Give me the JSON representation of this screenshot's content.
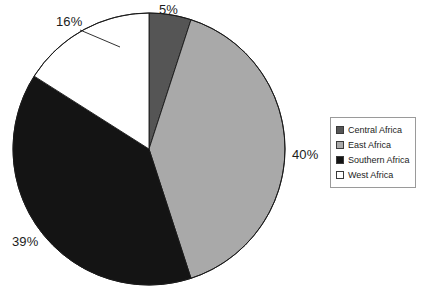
{
  "chart_data": {
    "type": "pie",
    "title": "",
    "subtitle": "",
    "xlabel": "",
    "ylabel": "",
    "grid": false,
    "legend_position": "right",
    "start_angle_deg": 0,
    "direction": "clockwise",
    "categories": [
      "Central Africa",
      "East Africa",
      "Southern Africa",
      "West Africa"
    ],
    "values": [
      5,
      40,
      39,
      16
    ],
    "value_unit": "%",
    "data_labels": [
      "5%",
      "40%",
      "39%",
      "16%"
    ],
    "colors": [
      "#555555",
      "#a9a9a9",
      "#141414",
      "#ffffff"
    ],
    "slices": [
      {
        "label": "Central Africa",
        "value": 5,
        "display": "5%",
        "color": "#555555",
        "start_deg": 0,
        "end_deg": 18.0
      },
      {
        "label": "East Africa",
        "value": 40,
        "display": "40%",
        "color": "#a9a9a9",
        "start_deg": 18.0,
        "end_deg": 162.0
      },
      {
        "label": "Southern Africa",
        "value": 39,
        "display": "39%",
        "color": "#141414",
        "start_deg": 162.0,
        "end_deg": 302.4
      },
      {
        "label": "West Africa",
        "value": 16,
        "display": "16%",
        "color": "#ffffff",
        "start_deg": 302.4,
        "end_deg": 360.0
      }
    ]
  },
  "labels": {
    "central": "5%",
    "east": "40%",
    "southern": "39%",
    "west": "16%"
  },
  "legend": {
    "items": [
      {
        "label": "Central Africa",
        "color": "#555555"
      },
      {
        "label": "East Africa",
        "color": "#a9a9a9"
      },
      {
        "label": "Southern Africa",
        "color": "#141414"
      },
      {
        "label": "West Africa",
        "color": "#ffffff"
      }
    ]
  },
  "style": {
    "background": "#ffffff",
    "outline": "#1a1a1a",
    "legend_border": "#9a9a9a"
  }
}
